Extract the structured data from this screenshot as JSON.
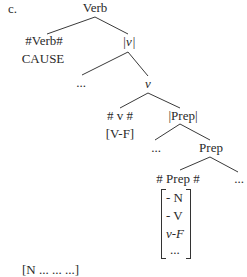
{
  "label": "c.",
  "tree": {
    "root": "Verb",
    "verb_head": "#Verb#",
    "verb_head_feature": "CAUSE",
    "v_bar": "|v|",
    "v_bar_left": "...",
    "v_node": "v",
    "v_head": "# v #",
    "v_head_feature": "[V-F]",
    "prep_bar": "|Prep|",
    "prep_bar_left": "...",
    "prep_node": "Prep",
    "prep_head": "# Prep #",
    "prep_right": "...",
    "prep_features": [
      "- N",
      "- V",
      "v-F",
      "..."
    ]
  },
  "cutoff_text": "[N ... ... ...]"
}
